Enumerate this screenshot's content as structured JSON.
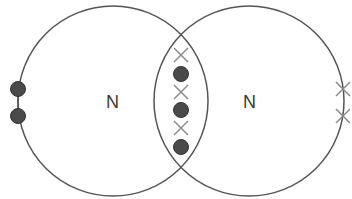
{
  "diagram": {
    "type": "dot-and-cross",
    "colors": {
      "outline": "#555555",
      "dot_fill": "#4a4a4a",
      "cross": "#8a8a8a",
      "label": "#3a3a3a"
    },
    "atoms": [
      {
        "symbol": "N",
        "cx": 113,
        "cy": 101,
        "r": 95,
        "label_x": 106,
        "label_y": 108
      },
      {
        "symbol": "N",
        "cx": 249,
        "cy": 101,
        "r": 95,
        "label_x": 243,
        "label_y": 108
      }
    ],
    "shared_electrons": [
      {
        "kind": "cross",
        "x": 181,
        "y": 55
      },
      {
        "kind": "dot",
        "x": 181,
        "y": 74
      },
      {
        "kind": "cross",
        "x": 181,
        "y": 92
      },
      {
        "kind": "dot",
        "x": 181,
        "y": 110
      },
      {
        "kind": "cross",
        "x": 181,
        "y": 128
      },
      {
        "kind": "dot",
        "x": 181,
        "y": 147
      }
    ],
    "lone_pair_left": [
      {
        "kind": "dot",
        "x": 18,
        "y": 89
      },
      {
        "kind": "dot",
        "x": 18,
        "y": 116
      }
    ],
    "lone_pair_right": [
      {
        "kind": "cross",
        "x": 343,
        "y": 89
      },
      {
        "kind": "cross",
        "x": 343,
        "y": 116
      }
    ]
  }
}
